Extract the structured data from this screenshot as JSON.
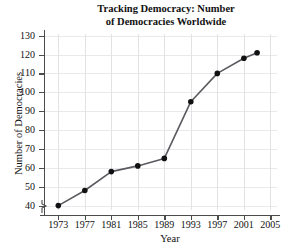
{
  "chart_data": {
    "type": "line",
    "title": "Tracking Democracy: Number of Democracies Worldwide",
    "title_line1": "Tracking Democracy: Number",
    "title_line2": "of Democracies Worldwide",
    "xlabel": "Year",
    "ylabel": "Number of Democracies",
    "x": [
      1973,
      1977,
      1981,
      1985,
      1989,
      1993,
      1997,
      2001,
      2003
    ],
    "values": [
      40,
      48,
      58,
      61,
      65,
      95,
      110,
      118,
      121
    ],
    "xlim": [
      1971,
      2006
    ],
    "ylim": [
      35,
      133
    ],
    "xticks": [
      1973,
      1977,
      1981,
      1985,
      1989,
      1993,
      1997,
      2001,
      2005
    ],
    "yticks": [
      40,
      50,
      60,
      70,
      80,
      90,
      100,
      110,
      120,
      130
    ],
    "xtick_labels": [
      "1973",
      "1977",
      "1981",
      "1985",
      "1989",
      "1993",
      "1997",
      "2001",
      "2005"
    ],
    "ytick_labels": [
      "40",
      "50",
      "60",
      "70",
      "80",
      "90",
      "100",
      "110",
      "120",
      "130"
    ],
    "grid": true,
    "legend": null,
    "axis_break": "y-axis break below 40",
    "marker": "filled-circle",
    "colors": {
      "line": "#5a5a60",
      "marker": "#111111",
      "grid": "#e6e6ea",
      "axis": "#4b4b4b",
      "background": "#ffffff"
    }
  }
}
